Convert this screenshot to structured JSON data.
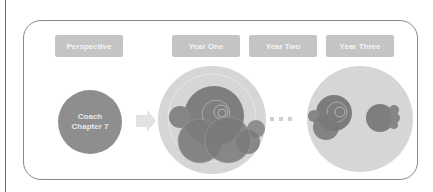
{
  "headers": [
    {
      "label": "Perspective"
    },
    {
      "label": "Year One"
    },
    {
      "label": "Year Two"
    },
    {
      "label": "Year Three"
    }
  ],
  "coach": {
    "line1": "Coach",
    "line2": "Chapter 7"
  },
  "icons": {
    "arrow": "right-arrow-icon",
    "ellipsis": "ellipsis-dots-icon"
  },
  "colors": {
    "pill_bg": "#c4c4c4",
    "pill_text": "#f4f4f4",
    "coach_circle": "#8e8e8e",
    "outer_circle": "#d6d6d6",
    "inner_circle": "#7a7a7a",
    "arrow": "#e2e2e2",
    "frame_border": "#8a8a8a"
  }
}
